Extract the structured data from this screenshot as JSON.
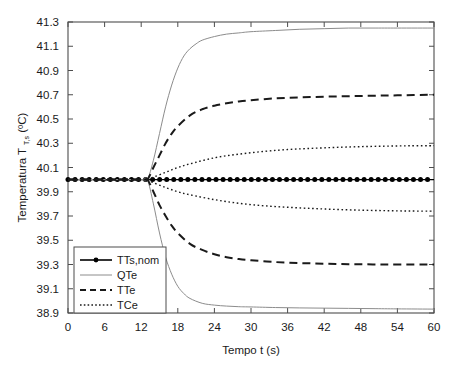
{
  "chart_data": {
    "type": "line",
    "title": "",
    "xlabel": "Tempo t (s)",
    "ylabel_main": "Temperatura T",
    "ylabel_sub": "T,s",
    "ylabel_unit": "(ºC)",
    "xlim": [
      0,
      60
    ],
    "ylim": [
      38.9,
      41.3
    ],
    "xticks": [
      0,
      6,
      12,
      18,
      24,
      30,
      36,
      42,
      48,
      54,
      60
    ],
    "xticklabels": [
      "0",
      "6",
      "12",
      "18",
      "24",
      "30",
      "36",
      "42",
      "48",
      "54",
      "60"
    ],
    "yticks": [
      38.9,
      39.1,
      39.3,
      39.5,
      39.7,
      39.9,
      40.1,
      40.3,
      40.5,
      40.7,
      40.9,
      41.1,
      41.3
    ],
    "yticklabels": [
      "38.9",
      "39.1",
      "39.3",
      "39.5",
      "39.7",
      "39.9",
      "40.1",
      "40.3",
      "40.5",
      "40.7",
      "40.9",
      "41.1",
      "41.3"
    ],
    "grid": false,
    "legend_position": "lower left",
    "branch_time": 13,
    "baseline_value": 40.0,
    "series": [
      {
        "name": "TTs,nom",
        "style": "solid-marker",
        "color": "#000000",
        "width": 1.4,
        "marker": "circle",
        "x": [
          0,
          6,
          12,
          18,
          24,
          30,
          36,
          42,
          48,
          54,
          60
        ],
        "values": [
          40.0,
          40.0,
          40.0,
          40.0,
          40.0,
          40.0,
          40.0,
          40.0,
          40.0,
          40.0,
          40.0
        ]
      },
      {
        "name": "QTe",
        "style": "solid-thin",
        "color": "#8c8c8c",
        "width": 1.0,
        "branch": "upper",
        "x": [
          0,
          4,
          8,
          12,
          13,
          14,
          15,
          16,
          17,
          18,
          19,
          20,
          21,
          22,
          24,
          26,
          28,
          30,
          34,
          38,
          42,
          46,
          50,
          54,
          60
        ],
        "values": [
          40.0,
          40.0,
          40.0,
          40.0,
          40.0,
          40.16,
          40.38,
          40.6,
          40.78,
          40.92,
          41.02,
          41.08,
          41.12,
          41.15,
          41.18,
          41.2,
          41.21,
          41.22,
          41.23,
          41.24,
          41.245,
          41.25,
          41.25,
          41.25,
          41.25
        ]
      },
      {
        "name": "QTe",
        "style": "solid-thin",
        "color": "#8c8c8c",
        "width": 1.0,
        "branch": "lower",
        "x": [
          0,
          4,
          8,
          12,
          13,
          14,
          15,
          16,
          17,
          18,
          19,
          20,
          22,
          24,
          26,
          28,
          30,
          34,
          38,
          42,
          46,
          50,
          54,
          60
        ],
        "values": [
          40.0,
          40.0,
          40.0,
          40.0,
          40.0,
          39.8,
          39.56,
          39.36,
          39.22,
          39.12,
          39.06,
          39.02,
          38.98,
          38.965,
          38.957,
          38.952,
          38.95,
          38.945,
          38.942,
          38.94,
          38.938,
          38.936,
          38.934,
          38.932
        ]
      },
      {
        "name": "TTe",
        "style": "dashed",
        "color": "#1a1a1a",
        "width": 2.0,
        "branch": "upper",
        "x": [
          0,
          4,
          8,
          12,
          13,
          14,
          15,
          16,
          17,
          18,
          20,
          22,
          24,
          26,
          28,
          30,
          34,
          38,
          42,
          46,
          50,
          54,
          60
        ],
        "values": [
          40.0,
          40.0,
          40.0,
          40.0,
          40.0,
          40.1,
          40.2,
          40.3,
          40.38,
          40.44,
          40.53,
          40.58,
          40.61,
          40.63,
          40.645,
          40.655,
          40.67,
          40.678,
          40.684,
          40.688,
          40.692,
          40.695,
          40.7
        ]
      },
      {
        "name": "TTe",
        "style": "dashed",
        "color": "#1a1a1a",
        "width": 2.0,
        "branch": "lower",
        "x": [
          0,
          4,
          8,
          12,
          13,
          14,
          15,
          16,
          17,
          18,
          20,
          22,
          24,
          26,
          28,
          30,
          34,
          38,
          42,
          46,
          50,
          54,
          60
        ],
        "values": [
          40.0,
          40.0,
          40.0,
          40.0,
          40.0,
          39.9,
          39.79,
          39.7,
          39.62,
          39.56,
          39.47,
          39.42,
          39.385,
          39.36,
          39.345,
          39.335,
          39.32,
          39.312,
          39.307,
          39.303,
          39.301,
          39.3,
          39.3
        ]
      },
      {
        "name": "TCe",
        "style": "dotted",
        "color": "#1a1a1a",
        "width": 1.4,
        "branch": "upper",
        "x": [
          0,
          4,
          8,
          12,
          13,
          14,
          16,
          18,
          20,
          24,
          28,
          32,
          36,
          40,
          44,
          48,
          52,
          56,
          60
        ],
        "values": [
          40.0,
          40.0,
          40.0,
          40.0,
          40.0,
          40.02,
          40.06,
          40.1,
          40.13,
          40.18,
          40.21,
          40.232,
          40.248,
          40.258,
          40.266,
          40.272,
          40.276,
          40.279,
          40.28
        ]
      },
      {
        "name": "TCe",
        "style": "dotted",
        "color": "#1a1a1a",
        "width": 1.4,
        "branch": "lower",
        "x": [
          0,
          4,
          8,
          12,
          13,
          14,
          16,
          18,
          20,
          24,
          28,
          32,
          36,
          40,
          44,
          48,
          52,
          56,
          60
        ],
        "values": [
          40.0,
          40.0,
          40.0,
          40.0,
          40.0,
          39.975,
          39.935,
          39.9,
          39.875,
          39.835,
          39.805,
          39.785,
          39.772,
          39.762,
          39.754,
          39.748,
          39.744,
          39.741,
          39.74
        ]
      }
    ],
    "legend_entries": [
      {
        "label": "TTs,nom",
        "style": "solid-marker"
      },
      {
        "label": "QTe",
        "style": "solid-thin"
      },
      {
        "label": "TTe",
        "style": "dashed"
      },
      {
        "label": "TCe",
        "style": "dotted"
      }
    ]
  }
}
